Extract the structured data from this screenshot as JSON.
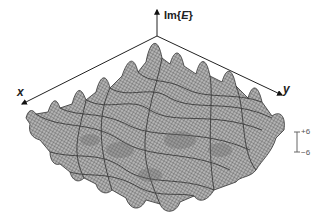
{
  "figure": {
    "type": "3d-wireframe-surface",
    "axes": {
      "vertical": {
        "label_prefix": "Im{",
        "label_var": "E",
        "label_suffix": "}"
      },
      "x": {
        "label": "x"
      },
      "y": {
        "label": "y"
      }
    },
    "scale_bar": {
      "top": "+6",
      "bottom": "−6"
    },
    "colors": {
      "mesh": "#555555",
      "fill": "#9a9a9a",
      "axis": "#222222",
      "scale_bar": "#666666"
    }
  }
}
